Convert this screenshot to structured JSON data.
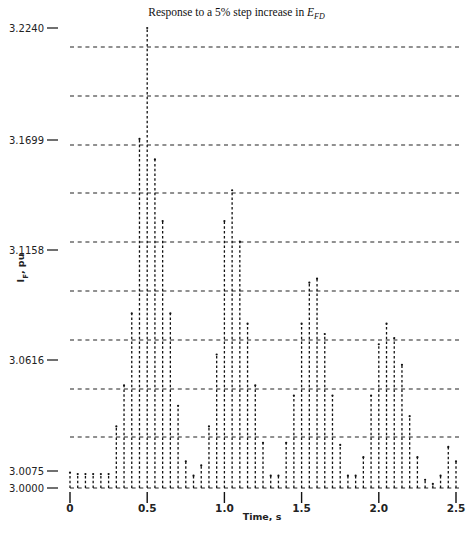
{
  "chart_data": {
    "type": "bar",
    "subtype": "stem / dotted vertical lines (line-printer plot)",
    "title_parts": {
      "prefix": "Response to a 5",
      "percent": "%",
      "middle": " step increase in ",
      "symbol": "E",
      "subscript": "FD"
    },
    "xlabel": "Time, s",
    "ylabel": "I_F, pu",
    "ylabel_parts": {
      "symbol": "I",
      "subscript": "F",
      "unit": ", pu"
    },
    "xlim": [
      0,
      2.5
    ],
    "ylim": [
      3.0,
      3.224
    ],
    "x_ticks": [
      "0",
      "0.5",
      "1.0",
      "1.5",
      "2.0",
      "2.5"
    ],
    "x_tick_values": [
      0,
      0.5,
      1.0,
      1.5,
      2.0,
      2.5
    ],
    "y_ticks": [
      "3.0000",
      "3.0075",
      "3.0616",
      "3.1158",
      "3.1699",
      "3.2240"
    ],
    "y_tick_values": [
      3.0,
      3.0075,
      3.0616,
      3.1158,
      3.1699,
      3.224
    ],
    "grid": "horizontal dashed lines",
    "legend": null,
    "x": [
      0.0,
      0.05,
      0.1,
      0.15,
      0.2,
      0.25,
      0.3,
      0.35,
      0.4,
      0.45,
      0.5,
      0.55,
      0.6,
      0.65,
      0.7,
      0.75,
      0.8,
      0.85,
      0.9,
      0.95,
      1.0,
      1.05,
      1.1,
      1.15,
      1.2,
      1.25,
      1.3,
      1.35,
      1.4,
      1.45,
      1.5,
      1.55,
      1.6,
      1.65,
      1.7,
      1.75,
      1.8,
      1.85,
      1.9,
      1.95,
      2.0,
      2.05,
      2.1,
      2.15,
      2.2,
      2.25,
      2.3,
      2.35,
      2.4,
      2.45,
      2.5
    ],
    "values": [
      3.0075,
      3.0068,
      3.0068,
      3.0068,
      3.0068,
      3.0068,
      3.03,
      3.05,
      3.085,
      3.17,
      3.224,
      3.16,
      3.13,
      3.085,
      3.04,
      3.013,
      3.006,
      3.011,
      3.03,
      3.065,
      3.13,
      3.145,
      3.12,
      3.08,
      3.05,
      3.022,
      3.006,
      3.006,
      3.022,
      3.045,
      3.08,
      3.1,
      3.102,
      3.075,
      3.045,
      3.021,
      3.006,
      3.006,
      3.015,
      3.045,
      3.07,
      3.08,
      3.073,
      3.06,
      3.035,
      3.015,
      3.004,
      3.002,
      3.006,
      3.02,
      3.013
    ]
  },
  "caption": ""
}
